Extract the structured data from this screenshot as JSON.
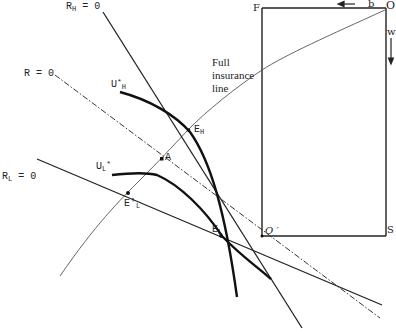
{
  "diagram": {
    "type": "insurance-market-equilibrium",
    "lines": {
      "r_h": {
        "label_main": "R",
        "label_sub": "H",
        "label_rest": " = 0"
      },
      "r": {
        "label_main": "R",
        "label_rest": " = 0"
      },
      "r_l": {
        "label_main": "R",
        "label_sub": "L",
        "label_rest": " = 0"
      },
      "full_insurance": {
        "line1": "Full",
        "line2": "insurance",
        "line3": "line"
      }
    },
    "curves": {
      "u_h": {
        "main": "U",
        "sup": "*",
        "sub": "H"
      },
      "u_l": {
        "main": "U",
        "sub": "L",
        "sup": "*"
      }
    },
    "points": {
      "e_h": {
        "main": "E",
        "sub": "H"
      },
      "e_l": {
        "main": "E",
        "sub": "L"
      },
      "e_l_prime": {
        "main": "E",
        "prime": "′",
        "sub": "L"
      },
      "a": {
        "main": "A"
      }
    },
    "box": {
      "corner_f": "F",
      "corner_o": "O",
      "corner_o_prime": "O ′",
      "corner_s": "S",
      "axis_b": "b",
      "axis_w": "w"
    },
    "colors": {
      "ink": "#222222",
      "thin": "#444444",
      "background": "#ffffff"
    }
  }
}
